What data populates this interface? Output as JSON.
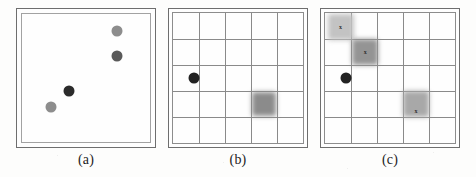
{
  "figure": {
    "panel_count": 3,
    "background_color": "#fdfdfc",
    "frame_color": "#6e6e6e",
    "grid_color": "#8a8a8a"
  },
  "panels": [
    {
      "id": "a",
      "caption": "(a)",
      "type": "scatter",
      "grid": false,
      "grid_rows": 0,
      "grid_cols": 0,
      "dots": [
        {
          "name": "dot-light-top-right",
          "x_pct": 74,
          "y_pct": 13,
          "diameter_px": 11,
          "color": "#8d8d8d",
          "shade": "light-gray"
        },
        {
          "name": "dot-dark-right",
          "x_pct": 74,
          "y_pct": 33,
          "diameter_px": 11,
          "color": "#5a5a5a",
          "shade": "dark-gray"
        },
        {
          "name": "dot-black-center",
          "x_pct": 37,
          "y_pct": 60,
          "diameter_px": 11,
          "color": "#2b2b2b",
          "shade": "black"
        },
        {
          "name": "dot-light-bottom-left",
          "x_pct": 23,
          "y_pct": 73,
          "diameter_px": 11,
          "color": "#8d8d8d",
          "shade": "light-gray"
        }
      ],
      "blobs": []
    },
    {
      "id": "b",
      "caption": "(b)",
      "type": "grid",
      "grid": true,
      "grid_rows": 5,
      "grid_cols": 5,
      "dots": [
        {
          "name": "dot-black-agent",
          "x_pct": 16,
          "y_pct": 50,
          "diameter_px": 11,
          "color": "#222222",
          "shade": "black"
        }
      ],
      "blobs": [
        {
          "name": "blob-cell-r4c4",
          "x_pct": 70,
          "y_pct": 70,
          "size_px": 24,
          "color": "#8b8b8b",
          "label": ""
        }
      ]
    },
    {
      "id": "c",
      "caption": "(c)",
      "type": "grid",
      "grid": true,
      "grid_rows": 5,
      "grid_cols": 5,
      "dots": [
        {
          "name": "dot-black-agent",
          "x_pct": 16,
          "y_pct": 50,
          "diameter_px": 11,
          "color": "#222222",
          "shade": "black"
        }
      ],
      "blobs": [
        {
          "name": "blob-cell-r1c1",
          "x_pct": 12,
          "y_pct": 11,
          "size_px": 26,
          "color": "#c3c3c3",
          "label": "x"
        },
        {
          "name": "blob-cell-r2c2",
          "x_pct": 31,
          "y_pct": 30,
          "size_px": 26,
          "color": "#949494",
          "label": "x"
        },
        {
          "name": "blob-cell-r4c4",
          "x_pct": 70,
          "y_pct": 70,
          "size_px": 26,
          "color": "#a8a8a8",
          "label": "x"
        }
      ]
    }
  ]
}
